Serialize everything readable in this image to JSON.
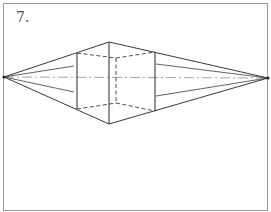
{
  "figure": {
    "label": "7.",
    "colors": {
      "stroke": "#3a3a3a",
      "frame": "#9a9a9a",
      "horizon": "#8a8a8a",
      "background": "#ffffff"
    },
    "frame": {
      "x": 3,
      "y": 3,
      "width": 264,
      "height": 207
    },
    "vanishing_points": {
      "left": {
        "x": 4,
        "y": 77
      },
      "right": {
        "x": 268,
        "y": 78
      }
    },
    "cube": {
      "front_edge": {
        "x": 109,
        "top": 42,
        "bottom": 124
      },
      "left_edge": {
        "x": 77,
        "top": 53,
        "bottom": 109
      },
      "right_edge": {
        "x": 155,
        "top": 52,
        "bottom": 111
      },
      "hidden_back_edge": {
        "x": 116,
        "top": 58,
        "bottom": 103
      }
    },
    "guide_lines": {
      "left": [
        {
          "x2": 74,
          "y2": 66
        },
        {
          "x2": 74,
          "y2": 92
        }
      ],
      "right": [
        {
          "x2": 156,
          "y2": 64
        },
        {
          "x2": 156,
          "y2": 96
        }
      ]
    }
  }
}
